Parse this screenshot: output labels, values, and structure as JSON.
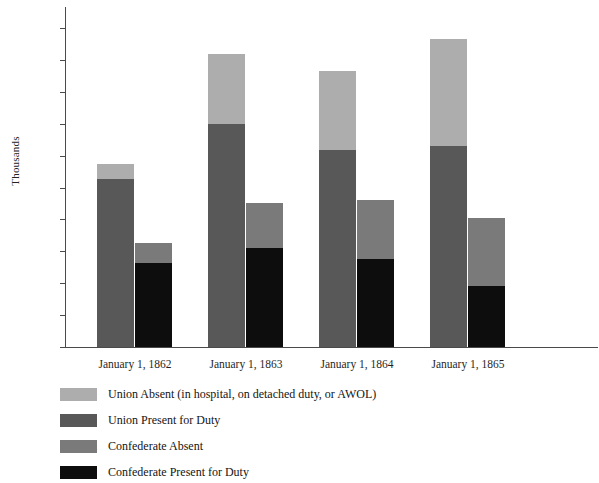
{
  "chart_data": {
    "type": "bar",
    "title": "",
    "xlabel": "",
    "ylabel": "Thousands",
    "ylim": [
      0,
      1000
    ],
    "yticks": [
      0,
      100,
      200,
      300,
      400,
      500,
      600,
      700,
      800,
      900,
      1000
    ],
    "ytick_labels": [
      "0",
      "100",
      "200",
      "300",
      "400",
      "500",
      "600",
      "700",
      "800",
      "900",
      "1,000"
    ],
    "grid": false,
    "legend_position": "below",
    "stacked": true,
    "categories": [
      "January 1, 1862",
      "January 1, 1863",
      "January 1, 1864",
      "January 1, 1865"
    ],
    "series": [
      {
        "name": "Union Present for Duty",
        "key": "union_present",
        "color": "#585858",
        "values": [
          527,
          698,
          617,
          630
        ]
      },
      {
        "name": "Union Absent (in hospital, on detached duty, or AWOL)",
        "key": "union_absent",
        "color": "#adadad",
        "values": [
          48,
          222,
          248,
          335
        ]
      },
      {
        "name": "Confederate Present for Duty",
        "key": "conf_present",
        "color": "#0d0d0d",
        "values": [
          262,
          311,
          277,
          190
        ]
      },
      {
        "name": "Confederate Absent",
        "key": "conf_absent",
        "color": "#7a7a7a",
        "values": [
          64,
          142,
          184,
          214
        ]
      }
    ],
    "bar_totals": {
      "union": [
        575,
        920,
        865,
        965
      ],
      "confederate": [
        326,
        453,
        461,
        404
      ]
    },
    "colors": {
      "union_absent": "#adadad",
      "union_present": "#585858",
      "confederate_absent": "#7a7a7a",
      "confederate_present": "#0d0d0d",
      "axis": "#4a4a4a",
      "text": "#1a1a1a"
    }
  },
  "axis": {
    "y_title": "Thousands",
    "tick_labels": [
      "1,000",
      "900",
      "800",
      "700",
      "600",
      "500",
      "400",
      "300",
      "200",
      "100",
      "0"
    ]
  },
  "x_labels": [
    "January 1, 1862",
    "January 1, 1863",
    "January 1, 1864",
    "January 1, 1865"
  ],
  "legend": {
    "items": [
      {
        "label": "Union Absent (in hospital, on detached duty, or AWOL)",
        "color": "#adadad"
      },
      {
        "label": "Union Present for Duty",
        "color": "#585858"
      },
      {
        "label": "Confederate Absent",
        "color": "#7a7a7a"
      },
      {
        "label": "Confederate Present for Duty",
        "color": "#0d0d0d"
      }
    ]
  }
}
